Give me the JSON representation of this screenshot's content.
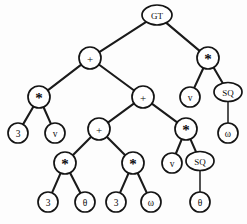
{
  "figure": {
    "name": "expression-tree",
    "type": "tree-diagram",
    "background_color": "#fdfdfd",
    "stroke_color": "#141414",
    "node_fill": "#ffffff"
  },
  "chart_data": {
    "type": "tree",
    "title": "",
    "expression": "GT( + ( * (3, v), + ( + ( * (3, θ), * (3, ω) ), * ( v, SQ(θ) ) ) ), * ( v, SQ(ω) ) )",
    "node_count": 23,
    "depth": 6
  },
  "nodes": [
    {
      "id": "n0",
      "label": "GT",
      "shape": "ellipse",
      "kind": "function",
      "x": 157,
      "y": 15,
      "rx": 15,
      "ry": 10
    },
    {
      "id": "n1",
      "label": "+",
      "shape": "circle",
      "kind": "operator",
      "x": 90,
      "y": 58,
      "r": 11
    },
    {
      "id": "n2",
      "label": "*",
      "shape": "circle",
      "kind": "operator",
      "x": 208,
      "y": 58,
      "r": 11
    },
    {
      "id": "n3",
      "label": "*",
      "shape": "circle",
      "kind": "operator",
      "x": 39,
      "y": 97,
      "r": 11
    },
    {
      "id": "n4",
      "label": "+",
      "shape": "circle",
      "kind": "operator",
      "x": 143,
      "y": 97,
      "r": 11
    },
    {
      "id": "n5",
      "label": "v",
      "shape": "circle",
      "kind": "terminal",
      "x": 190,
      "y": 97,
      "r": 10
    },
    {
      "id": "n6",
      "label": "SQ",
      "shape": "ellipse",
      "kind": "function",
      "x": 228,
      "y": 92,
      "rx": 14,
      "ry": 9.5
    },
    {
      "id": "n7",
      "label": "3",
      "shape": "circle",
      "kind": "terminal",
      "x": 18,
      "y": 133,
      "r": 10
    },
    {
      "id": "n8",
      "label": "v",
      "shape": "circle",
      "kind": "terminal",
      "x": 55,
      "y": 133,
      "r": 10
    },
    {
      "id": "n9",
      "label": "+",
      "shape": "circle",
      "kind": "operator",
      "x": 99,
      "y": 129,
      "r": 11
    },
    {
      "id": "n10",
      "label": "*",
      "shape": "circle",
      "kind": "operator",
      "x": 186,
      "y": 129,
      "r": 11
    },
    {
      "id": "n11",
      "label": "ω",
      "shape": "circle",
      "kind": "terminal",
      "x": 228,
      "y": 133,
      "r": 10
    },
    {
      "id": "n12",
      "label": "*",
      "shape": "circle",
      "kind": "operator",
      "x": 65,
      "y": 163,
      "r": 11
    },
    {
      "id": "n13",
      "label": "*",
      "shape": "circle",
      "kind": "operator",
      "x": 133,
      "y": 163,
      "r": 11
    },
    {
      "id": "n14",
      "label": "v",
      "shape": "circle",
      "kind": "terminal",
      "x": 172,
      "y": 163,
      "r": 10
    },
    {
      "id": "n15",
      "label": "SQ",
      "shape": "ellipse",
      "kind": "function",
      "x": 200,
      "y": 161,
      "rx": 14,
      "ry": 9.5
    },
    {
      "id": "n16",
      "label": "3",
      "shape": "circle",
      "kind": "terminal",
      "x": 48,
      "y": 202,
      "r": 10
    },
    {
      "id": "n17",
      "label": "θ",
      "shape": "circle",
      "kind": "terminal",
      "x": 85,
      "y": 202,
      "r": 10
    },
    {
      "id": "n18",
      "label": "3",
      "shape": "circle",
      "kind": "terminal",
      "x": 116,
      "y": 202,
      "r": 10
    },
    {
      "id": "n19",
      "label": "ω",
      "shape": "circle",
      "kind": "terminal",
      "x": 151,
      "y": 202,
      "r": 10
    },
    {
      "id": "n20",
      "label": "θ",
      "shape": "circle",
      "kind": "terminal",
      "x": 200,
      "y": 202,
      "r": 10
    }
  ],
  "edges": [
    {
      "from": "n0",
      "to": "n1"
    },
    {
      "from": "n0",
      "to": "n2"
    },
    {
      "from": "n1",
      "to": "n3"
    },
    {
      "from": "n1",
      "to": "n4"
    },
    {
      "from": "n2",
      "to": "n5"
    },
    {
      "from": "n2",
      "to": "n6"
    },
    {
      "from": "n3",
      "to": "n7"
    },
    {
      "from": "n3",
      "to": "n8"
    },
    {
      "from": "n4",
      "to": "n9"
    },
    {
      "from": "n4",
      "to": "n10"
    },
    {
      "from": "n6",
      "to": "n11"
    },
    {
      "from": "n9",
      "to": "n12"
    },
    {
      "from": "n9",
      "to": "n13"
    },
    {
      "from": "n10",
      "to": "n14"
    },
    {
      "from": "n10",
      "to": "n15"
    },
    {
      "from": "n12",
      "to": "n16"
    },
    {
      "from": "n12",
      "to": "n17"
    },
    {
      "from": "n13",
      "to": "n18"
    },
    {
      "from": "n13",
      "to": "n19"
    },
    {
      "from": "n15",
      "to": "n20"
    }
  ]
}
